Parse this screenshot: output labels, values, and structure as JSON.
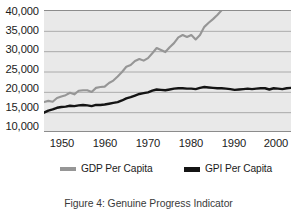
{
  "chart_data": {
    "type": "line",
    "title": "",
    "subtitle": "",
    "xlabel": "",
    "ylabel": "",
    "xlim": [
      1947,
      2004
    ],
    "ylim": [
      10000,
      40000
    ],
    "grid": true,
    "legend_position": "bottom",
    "y_ticks": [
      40000,
      35000,
      30000,
      25000,
      20000,
      15000,
      10000
    ],
    "y_tick_labels": [
      "40,000",
      "35,000",
      "30,000",
      "25,000",
      "20,000",
      "15,000",
      "10,000"
    ],
    "x_ticks": [
      1950,
      1960,
      1970,
      1980,
      1990,
      2000
    ],
    "x_tick_labels": [
      "1950",
      "1960",
      "1970",
      "1980",
      "1990",
      "2000"
    ],
    "x": [
      1947,
      1948,
      1949,
      1950,
      1951,
      1952,
      1953,
      1954,
      1955,
      1956,
      1957,
      1958,
      1959,
      1960,
      1961,
      1962,
      1963,
      1964,
      1965,
      1966,
      1967,
      1968,
      1969,
      1970,
      1971,
      1972,
      1973,
      1974,
      1975,
      1976,
      1977,
      1978,
      1979,
      1980,
      1981,
      1982,
      1983,
      1984,
      1985,
      1986,
      1987,
      1988,
      1989,
      1990,
      1991,
      1992,
      1993,
      1994,
      1995,
      1996,
      1997,
      1998,
      1999,
      2000,
      2001,
      2002,
      2003,
      2004
    ],
    "series": [
      {
        "name": "GDP Per Capita",
        "color": "#969696",
        "values": [
          17600,
          17900,
          17700,
          18600,
          19000,
          19300,
          19900,
          19500,
          20400,
          20500,
          20500,
          20100,
          21100,
          21300,
          21400,
          22300,
          22900,
          23900,
          25000,
          26300,
          26700,
          27700,
          28200,
          27800,
          28400,
          29600,
          30900,
          30400,
          29900,
          31100,
          32100,
          33500,
          34100,
          33600,
          34100,
          33000,
          34100,
          36100,
          37100,
          38000,
          39000,
          40200,
          41100,
          41300,
          40700,
          41500,
          42100,
          43300,
          44000,
          45200,
          46700,
          48200,
          49900,
          51400,
          51300,
          51800,
          53000,
          54500
        ]
      },
      {
        "name": "GPI Per Capita",
        "color": "#141414",
        "values": [
          15000,
          15500,
          15800,
          16200,
          16400,
          16500,
          16700,
          16600,
          16800,
          16900,
          16800,
          16600,
          16900,
          16900,
          17000,
          17200,
          17400,
          17600,
          18000,
          18500,
          18800,
          19200,
          19600,
          19800,
          20000,
          20400,
          20700,
          20600,
          20500,
          20700,
          20900,
          21000,
          21000,
          20900,
          20900,
          20800,
          21100,
          21300,
          21200,
          21100,
          21000,
          21000,
          20900,
          20800,
          20600,
          20700,
          20800,
          20900,
          20800,
          20900,
          21000,
          21000,
          20700,
          21000,
          20900,
          20800,
          21000,
          21100
        ]
      }
    ]
  },
  "axes": {
    "y_labels": [
      "40,000",
      "35,000",
      "30,000",
      "25,000",
      "20,000",
      "15,000",
      "10,000"
    ],
    "x_labels": [
      "1950",
      "1960",
      "1970",
      "1980",
      "1990",
      "2000"
    ]
  },
  "legend": {
    "entries": [
      {
        "label": "GDP Per Capita",
        "color": "#969696"
      },
      {
        "label": "GPI Per Capita",
        "color": "#141414"
      }
    ]
  },
  "caption": {
    "text": "Figure 4: Genuine Progress Indicator"
  },
  "colors": {
    "plot_background": "#e9e9e9",
    "gridline": "#9a9a9a",
    "axis_line": "#8c8c8c",
    "gdp_line": "#969696",
    "gpi_line": "#141414",
    "text": "#1b1b1b"
  }
}
